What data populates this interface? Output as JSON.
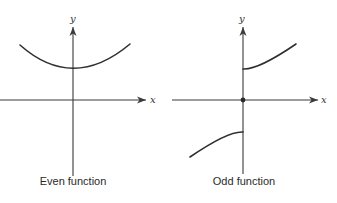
{
  "panels": [
    {
      "id": "even",
      "caption": "Even function",
      "x_axis_label": "x",
      "y_axis_label": "y"
    },
    {
      "id": "odd",
      "caption": "Odd function",
      "x_axis_label": "x",
      "y_axis_label": "y"
    }
  ],
  "colors": {
    "line": "#2f2f2f",
    "axis": "#3a3a3a",
    "background": "#ffffff"
  }
}
